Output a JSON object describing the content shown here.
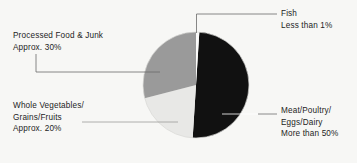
{
  "chart_data": {
    "type": "pie",
    "title": "",
    "subtitle": "",
    "xlabel": "",
    "ylabel": "",
    "grid": false,
    "legend_position": "callout-labels",
    "background_color": "#f7f7f5",
    "center": {
      "x": 196,
      "y": 85
    },
    "radius": 53,
    "start_angle_deg": 0,
    "direction": "clockwise",
    "categories": [
      "Fish",
      "Meat/Poultry/Eggs/Dairy",
      "Whole Vegetables/Grains/Fruits",
      "Processed Food & Junk"
    ],
    "values": [
      1,
      50,
      20,
      29
    ],
    "slices": [
      {
        "key": "fish",
        "name": "Fish",
        "value_text": "Less than 1%",
        "percent": 1,
        "color": "#fbfbfa",
        "label_lines": [
          "Fish",
          "Less than 1%"
        ]
      },
      {
        "key": "meat",
        "name": "Meat/Poultry/Eggs/Dairy",
        "value_text": "More than 50%",
        "percent": 50,
        "color": "#111111",
        "label_lines": [
          "Meat/Poultry/",
          "Eggs/Dairy",
          "More than 50%"
        ]
      },
      {
        "key": "vegetables",
        "name": "Whole Vegetables/Grains/Fruits",
        "value_text": "Approx. 20%",
        "percent": 20,
        "color": "#e8e8e6",
        "label_lines": [
          "Whole Vegetables/",
          "Grains/Fruits",
          "Approx. 20%"
        ]
      },
      {
        "key": "processed",
        "name": "Processed Food & Junk",
        "value_text": "Approx. 30%",
        "percent": 29,
        "color": "#9a9a9a",
        "label_lines": [
          "Processed Food & Junk",
          "Approx. 30%"
        ]
      }
    ],
    "colors": {
      "fish": "#fbfbfa",
      "meat": "#111111",
      "vegetables": "#e8e8e6",
      "processed": "#9a9a9a",
      "text": "#1d1d1d",
      "leader_dark": "#4a4a4a",
      "leader_light": "#f2f2f0",
      "background": "#f7f7f5"
    }
  },
  "labels": {
    "fish": {
      "line1": "Fish",
      "line2": "Less than 1%"
    },
    "processed": {
      "line1": "Processed Food & Junk",
      "line2": "Approx. 30%"
    },
    "vegetables": {
      "line1": "Whole Vegetables/",
      "line2": "Grains/Fruits",
      "line3": "Approx. 20%"
    },
    "meat": {
      "line1": "Meat/Poultry/",
      "line2": "Eggs/Dairy",
      "line3": "More than 50%"
    }
  }
}
